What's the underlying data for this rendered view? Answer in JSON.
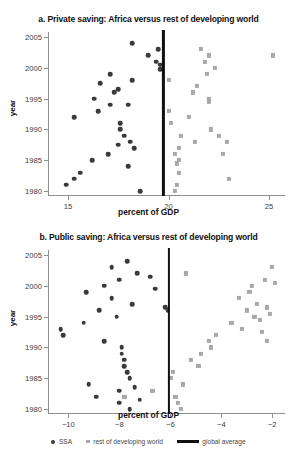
{
  "figure": {
    "ylabel": "year",
    "xlabel": "percent of GDP",
    "colors": {
      "ssa": "#3a3a3a",
      "rest_of_developing_world": "#a8a8a8",
      "global_average": "#101010",
      "axis": "#8f8f8f"
    }
  },
  "legend": {
    "items": [
      {
        "label": "SSA",
        "marker": "circle",
        "color": "#3a3a3a"
      },
      {
        "label": "rest of developing world",
        "marker": "square",
        "color": "#a8a8a8"
      },
      {
        "label": "global average",
        "marker": "line",
        "color": "#101010"
      }
    ]
  },
  "chart_data": [
    {
      "id": "panel-a",
      "type": "scatter",
      "title": "a. Private saving: Africa versus rest of developing world",
      "xlabel": "percent of GDP",
      "ylabel": "year",
      "xlim": [
        14.0,
        25.8
      ],
      "ylim": [
        1979.2,
        2005.8
      ],
      "xticks": [
        15,
        20,
        25
      ],
      "xticklabels": [
        "15",
        "20",
        "25"
      ],
      "yticks": [
        1980,
        1985,
        1990,
        1995,
        2000,
        2005
      ],
      "yticklabels": [
        "1980",
        "1985",
        "1990",
        "1995",
        "2000",
        "2005"
      ],
      "grid": false,
      "legend_position": "below-figure",
      "annotations": [
        {
          "type": "vline",
          "name": "global average",
          "x": 19.75,
          "color": "#101010"
        }
      ],
      "series": [
        {
          "name": "SSA",
          "marker": "circle",
          "color": "#3a3a3a",
          "points": [
            {
              "x": 14.9,
              "y": 1981
            },
            {
              "x": 15.3,
              "y": 1982
            },
            {
              "x": 15.6,
              "y": 1983
            },
            {
              "x": 15.3,
              "y": 1992
            },
            {
              "x": 16.2,
              "y": 1985
            },
            {
              "x": 16.5,
              "y": 1993
            },
            {
              "x": 16.3,
              "y": 1995
            },
            {
              "x": 16.6,
              "y": 1997.5
            },
            {
              "x": 17.0,
              "y": 1986
            },
            {
              "x": 17.1,
              "y": 1994
            },
            {
              "x": 17.3,
              "y": 1996
            },
            {
              "x": 17.1,
              "y": 1999
            },
            {
              "x": 17.5,
              "y": 1987.5
            },
            {
              "x": 17.6,
              "y": 1991
            },
            {
              "x": 17.6,
              "y": 1990
            },
            {
              "x": 17.8,
              "y": 1989
            },
            {
              "x": 17.5,
              "y": 1996.5
            },
            {
              "x": 18.0,
              "y": 1984
            },
            {
              "x": 18.1,
              "y": 1988
            },
            {
              "x": 18.0,
              "y": 1994
            },
            {
              "x": 18.3,
              "y": 1987
            },
            {
              "x": 18.2,
              "y": 1998
            },
            {
              "x": 18.6,
              "y": 1980
            },
            {
              "x": 18.2,
              "y": 2004
            },
            {
              "x": 19.0,
              "y": 2002
            },
            {
              "x": 19.4,
              "y": 2001
            },
            {
              "x": 19.5,
              "y": 2003
            },
            {
              "x": 19.6,
              "y": 2000.5
            },
            {
              "x": 19.6,
              "y": 1999.8
            }
          ]
        },
        {
          "name": "rest of developing world",
          "marker": "square",
          "color": "#a8a8a8",
          "points": [
            {
              "x": 20.0,
              "y": 1998
            },
            {
              "x": 20.0,
              "y": 1993
            },
            {
              "x": 20.1,
              "y": 1991
            },
            {
              "x": 20.3,
              "y": 1980
            },
            {
              "x": 20.4,
              "y": 1981
            },
            {
              "x": 20.5,
              "y": 1983
            },
            {
              "x": 20.5,
              "y": 1985
            },
            {
              "x": 20.4,
              "y": 1984.5
            },
            {
              "x": 20.5,
              "y": 1987
            },
            {
              "x": 20.6,
              "y": 1989
            },
            {
              "x": 20.3,
              "y": 1986
            },
            {
              "x": 21.0,
              "y": 1992
            },
            {
              "x": 21.2,
              "y": 1996
            },
            {
              "x": 21.4,
              "y": 1997
            },
            {
              "x": 21.3,
              "y": 1988
            },
            {
              "x": 21.6,
              "y": 2003
            },
            {
              "x": 21.8,
              "y": 2001
            },
            {
              "x": 21.9,
              "y": 1999
            },
            {
              "x": 22.0,
              "y": 1994.5
            },
            {
              "x": 22.0,
              "y": 1995
            },
            {
              "x": 22.0,
              "y": 2002
            },
            {
              "x": 22.1,
              "y": 1990
            },
            {
              "x": 22.3,
              "y": 2000
            },
            {
              "x": 22.5,
              "y": 1989
            },
            {
              "x": 22.7,
              "y": 1986
            },
            {
              "x": 22.9,
              "y": 1988
            },
            {
              "x": 23.0,
              "y": 1982
            },
            {
              "x": 25.2,
              "y": 2002
            }
          ]
        }
      ]
    },
    {
      "id": "panel-b",
      "type": "scatter",
      "title": "b. Public saving: Africa versus rest of developing world",
      "xlabel": "percent of GDP",
      "ylabel": "year",
      "xlim": [
        -10.8,
        -1.5
      ],
      "ylim": [
        1979.2,
        2005.8
      ],
      "xticks": [
        -10,
        -8,
        -6,
        -4,
        -2
      ],
      "xticklabels": [
        "−10",
        "−8",
        "−6",
        "−4",
        "−2"
      ],
      "yticks": [
        1980,
        1985,
        1990,
        1995,
        2000,
        2005
      ],
      "yticklabels": [
        "1980",
        "1985",
        "1990",
        "1995",
        "2000",
        "2005"
      ],
      "grid": false,
      "legend_position": "below-figure",
      "annotations": [
        {
          "type": "vline",
          "name": "global average",
          "x": -6.05,
          "color": "#101010"
        }
      ],
      "series": [
        {
          "name": "SSA",
          "marker": "circle",
          "color": "#3a3a3a",
          "points": [
            {
              "x": -10.3,
              "y": 1993
            },
            {
              "x": -10.2,
              "y": 1992
            },
            {
              "x": -9.3,
              "y": 1999
            },
            {
              "x": -9.4,
              "y": 1994
            },
            {
              "x": -9.2,
              "y": 1984
            },
            {
              "x": -8.8,
              "y": 1996
            },
            {
              "x": -8.6,
              "y": 2000
            },
            {
              "x": -8.9,
              "y": 1982
            },
            {
              "x": -8.6,
              "y": 1991
            },
            {
              "x": -8.3,
              "y": 2003
            },
            {
              "x": -8.3,
              "y": 1998
            },
            {
              "x": -8.0,
              "y": 1983
            },
            {
              "x": -8.0,
              "y": 1981
            },
            {
              "x": -8.0,
              "y": 2001
            },
            {
              "x": -8.1,
              "y": 1995
            },
            {
              "x": -7.9,
              "y": 1990
            },
            {
              "x": -7.9,
              "y": 1989
            },
            {
              "x": -7.8,
              "y": 1988
            },
            {
              "x": -7.8,
              "y": 1987
            },
            {
              "x": -7.7,
              "y": 1986
            },
            {
              "x": -7.6,
              "y": 1985
            },
            {
              "x": -7.7,
              "y": 2004
            },
            {
              "x": -7.5,
              "y": 1997
            },
            {
              "x": -7.6,
              "y": 1980
            },
            {
              "x": -7.4,
              "y": 1983.5
            },
            {
              "x": -7.3,
              "y": 2002
            },
            {
              "x": -7.2,
              "y": 1981.5
            },
            {
              "x": -6.8,
              "y": 2001.5
            },
            {
              "x": -6.6,
              "y": 1999.5
            },
            {
              "x": -6.2,
              "y": 1996.5
            },
            {
              "x": -6.1,
              "y": 1996
            }
          ]
        },
        {
          "name": "rest of developing world",
          "marker": "square",
          "color": "#a8a8a8",
          "points": [
            {
              "x": -7.8,
              "y": 1982
            },
            {
              "x": -6.7,
              "y": 1983
            },
            {
              "x": -5.9,
              "y": 1986
            },
            {
              "x": -6.0,
              "y": 1985
            },
            {
              "x": -5.8,
              "y": 1982
            },
            {
              "x": -5.7,
              "y": 1981
            },
            {
              "x": -5.6,
              "y": 1980
            },
            {
              "x": -5.5,
              "y": 1984
            },
            {
              "x": -5.4,
              "y": 2002
            },
            {
              "x": -5.2,
              "y": 1988
            },
            {
              "x": -4.9,
              "y": 1987
            },
            {
              "x": -4.8,
              "y": 1989
            },
            {
              "x": -4.5,
              "y": 1991
            },
            {
              "x": -4.4,
              "y": 1990
            },
            {
              "x": -4.2,
              "y": 1992
            },
            {
              "x": -3.6,
              "y": 1994
            },
            {
              "x": -3.3,
              "y": 1998
            },
            {
              "x": -3.2,
              "y": 1993
            },
            {
              "x": -3.0,
              "y": 1996
            },
            {
              "x": -2.9,
              "y": 1999
            },
            {
              "x": -2.8,
              "y": 2000
            },
            {
              "x": -2.7,
              "y": 1995
            },
            {
              "x": -2.6,
              "y": 1997
            },
            {
              "x": -2.5,
              "y": 1994.5
            },
            {
              "x": -2.4,
              "y": 1992.5
            },
            {
              "x": -2.3,
              "y": 2001
            },
            {
              "x": -2.2,
              "y": 1991
            },
            {
              "x": -2.1,
              "y": 1995.5
            },
            {
              "x": -2.0,
              "y": 2003
            },
            {
              "x": -1.9,
              "y": 2000.5
            },
            {
              "x": -2.2,
              "y": 1996.5
            }
          ]
        }
      ]
    }
  ]
}
